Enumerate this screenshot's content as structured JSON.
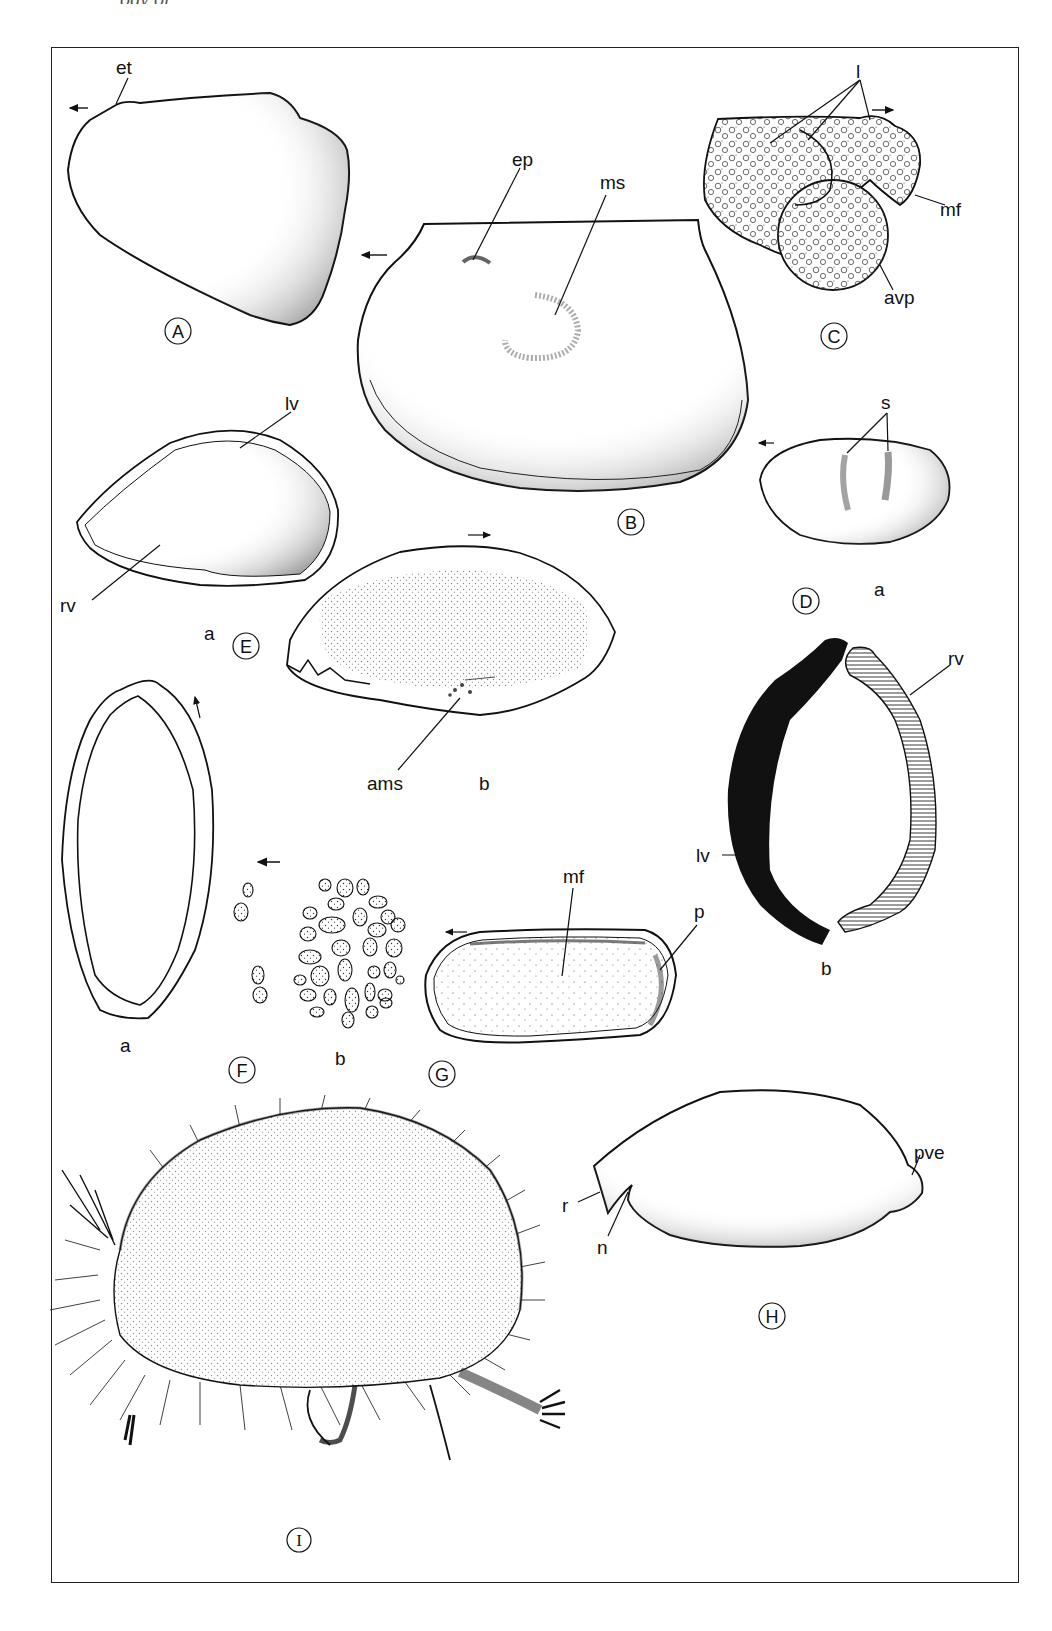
{
  "page": {
    "running_header_partial": "ogy of"
  },
  "figures": [
    {
      "id": "A",
      "label": "A",
      "annotations": [
        "et"
      ],
      "arrow": "left"
    },
    {
      "id": "B",
      "label": "B",
      "annotations": [
        "ep",
        "ms"
      ],
      "arrow": "left"
    },
    {
      "id": "C",
      "label": "C",
      "annotations": [
        "l",
        "mf",
        "avp"
      ],
      "arrow": "right"
    },
    {
      "id": "D",
      "label": "D",
      "annotations": [
        "s",
        "lv",
        "rv"
      ],
      "subparts": [
        "a",
        "b"
      ],
      "arrow": "left"
    },
    {
      "id": "E",
      "label": "E",
      "annotations": [
        "lv",
        "rv",
        "ams"
      ],
      "subparts": [
        "a",
        "b"
      ],
      "arrow": "right"
    },
    {
      "id": "F",
      "label": "F",
      "subparts": [
        "a",
        "b"
      ],
      "arrow": "left"
    },
    {
      "id": "G",
      "label": "G",
      "annotations": [
        "mf",
        "p"
      ],
      "arrow": "left"
    },
    {
      "id": "H",
      "label": "H",
      "annotations": [
        "r",
        "n",
        "pve"
      ]
    },
    {
      "id": "I",
      "label": "I"
    }
  ],
  "labels": {
    "A": "A",
    "B": "B",
    "C": "C",
    "D": "D",
    "E": "E",
    "F": "F",
    "G": "G",
    "H": "H",
    "I": "I",
    "et": "et",
    "ep": "ep",
    "ms": "ms",
    "l": "l",
    "mf": "mf",
    "avp": "avp",
    "s": "s",
    "lv": "lv",
    "rv": "rv",
    "ams": "ams",
    "p": "p",
    "r": "r",
    "n": "n",
    "pve": "pve",
    "a": "a",
    "b": "b"
  }
}
